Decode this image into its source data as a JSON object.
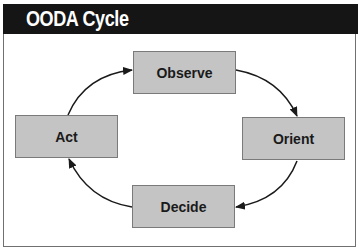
{
  "title": "OODA Cycle",
  "nodes": [
    {
      "id": "observe",
      "label": "Observe"
    },
    {
      "id": "orient",
      "label": "Orient"
    },
    {
      "id": "decide",
      "label": "Decide"
    },
    {
      "id": "act",
      "label": "Act"
    }
  ],
  "edges": [
    {
      "from": "Act",
      "to": "Observe"
    },
    {
      "from": "Observe",
      "to": "Orient"
    },
    {
      "from": "Orient",
      "to": "Decide"
    },
    {
      "from": "Decide",
      "to": "Act"
    }
  ],
  "colors": {
    "title_bar": "#151515",
    "title_text": "#ffffff",
    "node_fill": "#c4c4c4",
    "node_border": "#7a7a7a",
    "arrow": "#1a1a1a"
  }
}
